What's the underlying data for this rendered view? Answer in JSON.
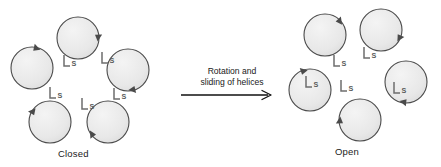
{
  "figure": {
    "type": "schematic-diagram",
    "background_color": "#ffffff"
  },
  "transition": {
    "label_line1": "Rotation and",
    "label_line2": "sliding of helices",
    "arrow_direction": "right",
    "arrow_color": "#111111"
  },
  "states": [
    {
      "id": "closed",
      "caption": "Closed",
      "subunit_count": 5,
      "center": {
        "x": 78,
        "y": 80
      },
      "ring_radius": 42,
      "circle_radius": 21,
      "helix_label": "S",
      "subunits": [
        {
          "index": 0,
          "cx": 78,
          "cy": 38,
          "s_label": "S",
          "s_x": 61,
          "s_y": 63,
          "helix_angle": -18
        },
        {
          "index": 1,
          "cx": 128,
          "cy": 70,
          "s_label": "S",
          "s_x": 99,
          "s_y": 60,
          "helix_angle": 54
        },
        {
          "index": 2,
          "cx": 108,
          "cy": 122,
          "s_label": "S",
          "s_x": 111,
          "s_y": 96,
          "helix_angle": 126
        },
        {
          "index": 3,
          "cx": 50,
          "cy": 122,
          "s_label": "S",
          "s_x": 79,
          "s_y": 106,
          "helix_angle": 198
        },
        {
          "index": 4,
          "cx": 32,
          "cy": 68,
          "s_label": "S",
          "s_x": 47,
          "s_y": 95,
          "helix_angle": 270
        }
      ]
    },
    {
      "id": "open",
      "caption": "Open",
      "subunit_count": 5,
      "center": {
        "x": 360,
        "y": 75
      },
      "ring_radius": 50,
      "circle_radius": 21,
      "helix_label": "S",
      "subunits": [
        {
          "index": 0,
          "cx": 381,
          "cy": 30,
          "s_label": "S",
          "s_x": 361,
          "s_y": 55,
          "helix_angle": 0
        },
        {
          "index": 1,
          "cx": 406,
          "cy": 82,
          "s_label": "S",
          "s_x": 391,
          "s_y": 90,
          "helix_angle": 72
        },
        {
          "index": 2,
          "cx": 360,
          "cy": 120,
          "s_label": "S",
          "s_x": 338,
          "s_y": 88,
          "helix_angle": 144
        },
        {
          "index": 3,
          "cx": 310,
          "cy": 90,
          "s_label": "S",
          "s_x": 303,
          "s_y": 84,
          "helix_angle": 216
        },
        {
          "index": 4,
          "cx": 325,
          "cy": 35,
          "s_label": "S",
          "s_x": 331,
          "s_y": 63,
          "helix_angle": 288
        }
      ]
    }
  ],
  "style": {
    "circle_fill": "#e9e9e9",
    "circle_stroke": "#4a4a4a",
    "helix_stroke": "#6e6e6e",
    "s_label_color": "#5a5a5a",
    "arrowhead_fill": "#4a4a4a",
    "caption_color": "#1a1a1a"
  }
}
